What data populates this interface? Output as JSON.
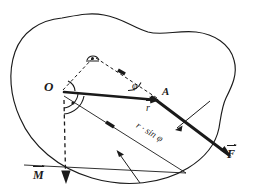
{
  "diagram": {
    "type": "mechanics-vector-diagram",
    "background_color": "#ffffff",
    "ink_color": "#1a1a1a",
    "labels": {
      "origin": "O",
      "point_a": "A",
      "angle": "φ",
      "moment_arm": "r · sin φ",
      "position_vector": "r",
      "force_vector": "F",
      "moment_vector": "M"
    },
    "elements": {
      "body_outline": "rigid-body-blob",
      "position_vector_line": "O-to-A",
      "force_line": "A-to-F",
      "moment_arm_line": "perpendicular-from-O",
      "construction_lines": "dashed-triangle",
      "moment_axis": "dashed-vertical-through-O",
      "right_angle_mark": "90-degree-marker-at-O",
      "angle_arcs": [
        "phi-arc-at-A",
        "arc-at-O",
        "arc-at-apex"
      ],
      "leader_lines": [
        "leader-to-force-line",
        "leader-to-moment-arm"
      ]
    },
    "geometry": {
      "origin_point": [
        62,
        92
      ],
      "point_a": [
        158,
        100
      ],
      "force_tip": [
        228,
        155
      ],
      "apex_point": [
        92,
        60
      ],
      "moment_arrow_tip": [
        67,
        182
      ]
    }
  }
}
